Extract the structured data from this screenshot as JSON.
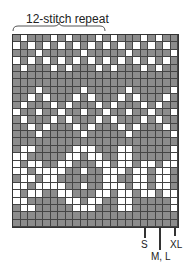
{
  "header": {
    "repeat_label": "12-stitch repeat"
  },
  "colors": {
    "contrast": "#8c8c8c",
    "main": "#ffffff",
    "gridline": "#444444"
  },
  "chart": {
    "columns": 22,
    "repeat_columns": 12,
    "rows": [
      "GWGGGWGWGGGWGWGGGWGWGG",
      "WGWGWGWGWGWGWGWGWGWGWG",
      "GGGWGGGGGWGGGGGWGGGGGW",
      "WGWGWGWGWGWGWGWGWGWGWG",
      "GWGGGWGWGGGWGWGGGWGWGG",
      "GGGGGGGGGGGGGGGGGGGGGG",
      "GGGGGGGGGGGGGGGGGGGGGG",
      "GGGWGGGGGWGGGGGWGGGGGW",
      "GGWGWGGGWGWGGGWGWGGGWG",
      "GWGGGWGWGGGWGWGGGWGWGG",
      "WGGWGGWGGWGGWGGWGGWGGW",
      "GWGGGWGWGGGWGWGGGWGWGG",
      "GGWGWGGGWGWGGGWGWGGGWG",
      "GGGWGGGGGWGGGGGWGGGGGW",
      "GGGGGGGGGGGGGGGGGGGGGG",
      "GWWGGGGGWWWGGGWWGGGGGW",
      "WWGGGGGWWGWWGGWWGGGGGW",
      "WGWWGGWWGGGWWGWWGWWGWW",
      "WWGWWWWGGWGGWWWGWWGWWG",
      "GWWGWWGGGGGGWWGGWWGWWG",
      "WWGWWWWGGWGGWWWGWWGWWG",
      "WGWWGGWWGGGWWGWWGWWGWW",
      "WWGGGGGWWGWWGGWWGGGGGW",
      "GWWGGGGGWWWGGGWWGGGGGW",
      "GGGGGGGGGGGGGGGGGGGGGG",
      "GGGGGGGGGGGGGGGGGGGGGG"
    ]
  },
  "size_markers": [
    {
      "label": "S",
      "x": 145
    },
    {
      "label": "M, L",
      "x": 160
    },
    {
      "label": "XL",
      "x": 175
    }
  ]
}
